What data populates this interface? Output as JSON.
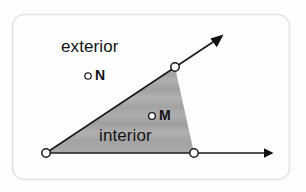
{
  "figure": {
    "width": 306,
    "height": 192,
    "background_color": "#fdfdfd",
    "frame": {
      "stroke_color": "#e2e2e2",
      "corner_radius": 12,
      "x": 12,
      "y": 14,
      "width": 278,
      "height": 166
    }
  },
  "labels": {
    "exterior": "exterior",
    "interior": "interior",
    "point_n": "N",
    "point_m": "M"
  },
  "geometry": {
    "vertex": {
      "x": 46,
      "y": 153
    },
    "ray_diagonal": {
      "from": {
        "x": 46,
        "y": 153
      },
      "to": {
        "x": 222,
        "y": 36
      },
      "marker_point": {
        "x": 175,
        "y": 67
      },
      "arrowhead": true,
      "stroke_color": "#1a1a1a",
      "stroke_width": 1.6
    },
    "ray_horizontal": {
      "from": {
        "x": 46,
        "y": 153
      },
      "to": {
        "x": 272,
        "y": 153
      },
      "marker_point": {
        "x": 194,
        "y": 153
      },
      "arrowhead": true,
      "stroke_color": "#1a1a1a",
      "stroke_width": 1.6
    },
    "shaded_region": {
      "name": "interior",
      "points": [
        {
          "x": 46,
          "y": 153
        },
        {
          "x": 175,
          "y": 67
        },
        {
          "x": 194,
          "y": 153
        }
      ],
      "fill_color": "#a9a9a9",
      "banding": true
    },
    "point_markers": {
      "fill_color": "#ffffff",
      "stroke_color": "#1a1a1a",
      "radius": 4
    }
  },
  "points": [
    {
      "id": "vertex",
      "label": "",
      "x": 46,
      "y": 153,
      "region": "vertex"
    },
    {
      "id": "n",
      "label": "N",
      "x": 88,
      "y": 76,
      "region": "exterior"
    },
    {
      "id": "m",
      "label": "M",
      "x": 152,
      "y": 116,
      "region": "interior"
    },
    {
      "id": "ray-diagonal-point",
      "label": "",
      "x": 175,
      "y": 67,
      "region": "boundary"
    },
    {
      "id": "ray-horizontal-point",
      "label": "",
      "x": 194,
      "y": 153,
      "region": "boundary"
    }
  ]
}
